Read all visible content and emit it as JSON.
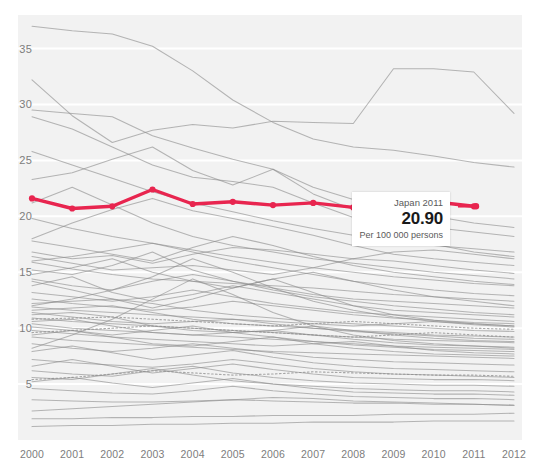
{
  "chart_data": {
    "type": "line",
    "title": "",
    "xlabel": "",
    "ylabel": "",
    "unit": "Per 100 000 persons",
    "x": [
      2000,
      2001,
      2002,
      2003,
      2004,
      2005,
      2006,
      2007,
      2008,
      2009,
      2010,
      2011,
      2012
    ],
    "xtick_labels": [
      "2000",
      "2001",
      "2002",
      "2003",
      "2004",
      "2005",
      "2006",
      "2007",
      "2008",
      "2009",
      "2010",
      "2011",
      "2012"
    ],
    "ytick_labels": [
      "35",
      "30",
      "25",
      "20",
      "15",
      "10",
      "5"
    ],
    "ytick_values": [
      35,
      30,
      25,
      20,
      15,
      10,
      5
    ],
    "ylim": [
      0,
      38
    ],
    "xlim": [
      2000,
      2012
    ],
    "grid": true,
    "legend": "none",
    "highlight_color": "#e8254f",
    "line_color": "#8c8c8c",
    "plot_background": "#f2f2f2",
    "highlight_series": {
      "name": "Japan",
      "values": [
        21.6,
        20.7,
        20.9,
        22.4,
        21.1,
        21.3,
        21.0,
        21.2,
        20.8,
        20.7,
        21.3,
        20.9
      ],
      "x": [
        2000,
        2001,
        2002,
        2003,
        2004,
        2005,
        2006,
        2007,
        2008,
        2009,
        2010,
        2011
      ]
    },
    "series": [
      {
        "name": "s01",
        "style": "solid",
        "values": [
          37.0,
          36.6,
          36.3,
          35.2,
          33.0,
          30.4,
          28.4,
          26.9,
          26.2,
          25.9,
          25.4,
          24.8,
          24.4
        ]
      },
      {
        "name": "s02",
        "style": "solid",
        "values": [
          32.2,
          29.0,
          26.6,
          27.7,
          28.2,
          27.9,
          28.5,
          28.4,
          28.3,
          33.2,
          33.2,
          32.9,
          29.2
        ]
      },
      {
        "name": "s03",
        "style": "solid",
        "values": [
          29.5,
          29.2,
          28.9,
          27.2,
          26.1,
          25.1,
          24.2,
          22.0,
          20.6,
          19.6,
          19.0,
          18.6,
          18.2
        ]
      },
      {
        "name": "s04",
        "style": "solid",
        "values": [
          28.9,
          27.8,
          26.2,
          24.6,
          23.5,
          23.1,
          22.6,
          21.2,
          19.9,
          18.6,
          17.5,
          16.8,
          16.4
        ]
      },
      {
        "name": "s05",
        "style": "solid",
        "values": [
          23.3,
          23.9,
          25.1,
          26.2,
          24.1,
          22.8,
          24.2,
          22.6,
          21.5,
          20.8,
          20.0,
          19.4,
          19.0
        ]
      },
      {
        "name": "s06",
        "style": "solid",
        "values": [
          18.0,
          19.4,
          20.6,
          21.6,
          20.5,
          19.8,
          19.1,
          18.3,
          17.4,
          16.6,
          16.2,
          15.9,
          15.6
        ]
      },
      {
        "name": "s07",
        "style": "solid",
        "values": [
          16.8,
          16.2,
          16.5,
          15.8,
          16.6,
          17.2,
          17.0,
          16.6,
          16.2,
          16.8,
          17.0,
          16.6,
          16.2
        ]
      },
      {
        "name": "s08",
        "style": "solid",
        "values": [
          16.4,
          15.8,
          15.2,
          15.4,
          15.6,
          15.2,
          14.8,
          15.4,
          16.2,
          16.0,
          15.6,
          15.2,
          14.9
        ]
      },
      {
        "name": "s09",
        "style": "solid",
        "values": [
          15.9,
          15.3,
          14.8,
          14.4,
          14.2,
          14.0,
          13.8,
          13.6,
          13.3,
          13.0,
          12.8,
          12.6,
          12.4
        ]
      },
      {
        "name": "s10",
        "style": "solid",
        "values": [
          15.2,
          14.8,
          15.6,
          16.8,
          15.2,
          14.2,
          13.4,
          12.8,
          12.4,
          12.0,
          11.7,
          11.4,
          11.2
        ]
      },
      {
        "name": "s11",
        "style": "solid",
        "values": [
          14.8,
          15.4,
          16.2,
          15.0,
          14.2,
          13.6,
          14.4,
          15.0,
          14.2,
          13.4,
          12.8,
          12.4,
          12.0
        ]
      },
      {
        "name": "s12",
        "style": "solid",
        "values": [
          14.4,
          13.8,
          13.4,
          14.2,
          14.8,
          14.2,
          13.6,
          13.0,
          12.6,
          12.4,
          12.2,
          12.0,
          11.8
        ]
      },
      {
        "name": "s13",
        "style": "solid",
        "values": [
          13.8,
          14.6,
          13.2,
          12.4,
          13.0,
          13.8,
          13.2,
          12.6,
          12.0,
          11.6,
          11.4,
          11.2,
          11.0
        ]
      },
      {
        "name": "s14",
        "style": "solid",
        "values": [
          13.2,
          12.8,
          12.4,
          12.8,
          13.4,
          12.8,
          12.2,
          11.8,
          11.4,
          11.2,
          11.0,
          10.8,
          10.6
        ]
      },
      {
        "name": "s15",
        "style": "solid",
        "values": [
          12.6,
          12.2,
          11.9,
          11.6,
          11.9,
          12.4,
          12.0,
          11.6,
          11.2,
          10.9,
          10.7,
          10.5,
          10.4
        ]
      },
      {
        "name": "s16",
        "style": "solid",
        "values": [
          12.2,
          12.4,
          12.6,
          12.2,
          11.6,
          11.2,
          10.9,
          10.6,
          10.4,
          10.2,
          10.0,
          9.8,
          9.7
        ]
      },
      {
        "name": "s17",
        "style": "solid",
        "values": [
          11.9,
          11.6,
          11.4,
          11.2,
          11.0,
          10.8,
          10.6,
          10.4,
          10.2,
          10.4,
          10.6,
          10.4,
          10.2
        ]
      },
      {
        "name": "s18",
        "style": "solid",
        "values": [
          11.6,
          11.8,
          12.0,
          11.4,
          10.8,
          10.4,
          10.2,
          10.0,
          9.8,
          9.6,
          9.4,
          9.3,
          9.2
        ]
      },
      {
        "name": "s19",
        "style": "solid",
        "values": [
          11.4,
          11.0,
          10.6,
          10.4,
          10.6,
          10.8,
          10.4,
          10.0,
          9.7,
          9.5,
          9.3,
          9.1,
          9.0
        ]
      },
      {
        "name": "s20",
        "style": "solid",
        "values": [
          11.2,
          11.4,
          11.0,
          10.2,
          9.8,
          9.6,
          9.8,
          10.2,
          9.8,
          9.4,
          9.1,
          8.9,
          8.8
        ]
      },
      {
        "name": "s21",
        "style": "solid",
        "values": [
          10.9,
          10.6,
          10.4,
          10.2,
          10.0,
          9.8,
          9.6,
          9.4,
          9.2,
          9.0,
          8.9,
          8.8,
          8.7
        ]
      },
      {
        "name": "s22",
        "style": "solid",
        "values": [
          10.6,
          10.8,
          10.2,
          9.6,
          9.4,
          9.6,
          9.8,
          9.4,
          9.0,
          8.7,
          8.5,
          8.4,
          8.3
        ]
      },
      {
        "name": "s23",
        "style": "solid",
        "values": [
          10.4,
          10.0,
          9.8,
          9.6,
          9.4,
          9.2,
          9.0,
          8.8,
          8.6,
          8.4,
          8.3,
          8.2,
          8.1
        ]
      },
      {
        "name": "s24",
        "style": "solid",
        "values": [
          10.1,
          9.8,
          9.4,
          9.8,
          10.2,
          9.6,
          9.2,
          8.8,
          8.5,
          8.3,
          8.1,
          8.0,
          7.9
        ]
      },
      {
        "name": "s25",
        "style": "solid",
        "values": [
          9.8,
          9.5,
          9.2,
          9.0,
          8.8,
          8.6,
          8.4,
          8.6,
          8.8,
          8.4,
          8.0,
          7.8,
          7.7
        ]
      },
      {
        "name": "s26",
        "style": "solid",
        "values": [
          9.4,
          9.8,
          9.2,
          8.6,
          8.4,
          8.8,
          9.2,
          8.6,
          8.2,
          7.9,
          7.7,
          7.6,
          7.5
        ]
      },
      {
        "name": "s27",
        "style": "solid",
        "values": [
          9.2,
          8.9,
          8.7,
          8.5,
          8.3,
          8.1,
          7.9,
          7.8,
          7.7,
          7.6,
          7.5,
          7.4,
          7.3
        ]
      },
      {
        "name": "s28",
        "style": "dotted",
        "values": [
          10.8,
          10.9,
          11.0,
          10.8,
          10.6,
          10.4,
          10.2,
          10.4,
          10.6,
          10.4,
          10.2,
          10.0,
          9.9
        ]
      },
      {
        "name": "s29",
        "style": "dotted",
        "values": [
          9.6,
          9.8,
          10.0,
          10.2,
          10.0,
          9.8,
          9.6,
          9.4,
          9.2,
          9.4,
          9.6,
          9.4,
          9.2
        ]
      },
      {
        "name": "s30",
        "style": "dotted",
        "values": [
          5.4,
          5.6,
          5.9,
          6.2,
          6.0,
          5.8,
          5.9,
          6.1,
          6.0,
          5.9,
          5.8,
          5.8,
          5.7
        ]
      },
      {
        "name": "s31",
        "style": "solid",
        "values": [
          8.6,
          8.2,
          7.9,
          8.2,
          8.6,
          8.2,
          7.8,
          7.4,
          7.2,
          7.0,
          6.9,
          6.8,
          6.7
        ]
      },
      {
        "name": "s32",
        "style": "solid",
        "values": [
          7.9,
          8.4,
          7.8,
          7.2,
          7.6,
          8.0,
          7.4,
          6.9,
          6.6,
          6.4,
          6.3,
          6.2,
          6.1
        ]
      },
      {
        "name": "s33",
        "style": "solid",
        "values": [
          7.2,
          6.9,
          6.7,
          6.5,
          6.8,
          7.2,
          6.8,
          6.4,
          6.1,
          5.9,
          5.8,
          5.7,
          5.6
        ]
      },
      {
        "name": "s34",
        "style": "solid",
        "values": [
          6.6,
          7.2,
          6.6,
          6.0,
          6.4,
          6.8,
          6.3,
          5.9,
          5.6,
          5.5,
          5.4,
          5.4,
          5.3
        ]
      },
      {
        "name": "s35",
        "style": "solid",
        "values": [
          6.2,
          5.9,
          5.7,
          6.2,
          6.6,
          6.0,
          5.6,
          5.3,
          5.1,
          5.0,
          4.9,
          4.9,
          4.8
        ]
      },
      {
        "name": "s36",
        "style": "solid",
        "values": [
          5.6,
          5.4,
          5.9,
          6.4,
          5.8,
          5.3,
          5.0,
          4.8,
          4.6,
          4.5,
          4.4,
          4.4,
          4.3
        ]
      },
      {
        "name": "s37",
        "style": "solid",
        "values": [
          5.2,
          5.6,
          5.1,
          4.7,
          5.1,
          5.5,
          5.0,
          4.6,
          4.3,
          4.2,
          4.1,
          4.1,
          4.0
        ]
      },
      {
        "name": "s38",
        "style": "solid",
        "values": [
          4.6,
          4.4,
          4.2,
          4.1,
          4.4,
          4.8,
          4.4,
          4.1,
          3.9,
          3.8,
          3.7,
          3.7,
          3.6
        ]
      },
      {
        "name": "s39",
        "style": "solid",
        "values": [
          3.6,
          3.5,
          3.4,
          3.4,
          3.5,
          3.6,
          3.5,
          3.4,
          3.3,
          3.3,
          3.2,
          3.2,
          3.1
        ]
      },
      {
        "name": "s40",
        "style": "solid",
        "values": [
          2.6,
          2.8,
          3.0,
          3.2,
          3.4,
          3.6,
          3.8,
          3.7,
          3.5,
          3.4,
          3.3,
          3.2,
          3.1
        ]
      },
      {
        "name": "s41",
        "style": "solid",
        "values": [
          1.9,
          1.9,
          2.0,
          2.0,
          2.1,
          2.1,
          2.2,
          2.2,
          2.2,
          2.3,
          2.3,
          2.3,
          2.4
        ]
      },
      {
        "name": "s42",
        "style": "solid",
        "values": [
          1.2,
          1.3,
          1.3,
          1.4,
          1.4,
          1.5,
          1.5,
          1.6,
          1.6,
          1.6,
          1.7,
          1.7,
          1.7
        ]
      },
      {
        "name": "s43",
        "style": "solid",
        "values": [
          17.8,
          17.2,
          16.6,
          16.0,
          17.2,
          18.2,
          17.4,
          16.4,
          15.6,
          15.0,
          14.6,
          14.2,
          13.9
        ]
      },
      {
        "name": "s44",
        "style": "solid",
        "values": [
          19.8,
          18.9,
          18.2,
          17.6,
          17.0,
          16.4,
          15.9,
          15.4,
          15.0,
          14.6,
          14.3,
          14.0,
          13.8
        ]
      },
      {
        "name": "s45",
        "style": "solid",
        "values": [
          21.2,
          22.6,
          21.0,
          19.4,
          18.2,
          17.4,
          16.8,
          16.2,
          15.8,
          15.4,
          15.0,
          14.7,
          14.4
        ]
      },
      {
        "name": "s46",
        "style": "solid",
        "values": [
          12.0,
          12.6,
          13.4,
          14.6,
          16.2,
          15.0,
          13.6,
          12.4,
          11.6,
          11.0,
          10.6,
          10.3,
          10.1
        ]
      },
      {
        "name": "s47",
        "style": "solid",
        "values": [
          8.2,
          9.4,
          10.8,
          12.6,
          14.4,
          13.0,
          11.4,
          10.2,
          9.4,
          8.9,
          8.6,
          8.4,
          8.2
        ]
      },
      {
        "name": "s48",
        "style": "solid",
        "values": [
          14.2,
          13.4,
          12.6,
          11.8,
          12.6,
          13.6,
          14.4,
          13.2,
          12.0,
          11.2,
          10.7,
          10.4,
          10.2
        ]
      },
      {
        "name": "s49",
        "style": "solid",
        "values": [
          16.0,
          16.4,
          17.0,
          17.6,
          16.8,
          16.0,
          15.4,
          14.8,
          14.2,
          13.8,
          13.4,
          13.1,
          12.9
        ]
      },
      {
        "name": "s50",
        "style": "solid",
        "values": [
          25.8,
          24.6,
          23.4,
          22.2,
          21.2,
          20.4,
          19.6,
          18.9,
          18.3,
          17.8,
          17.4,
          17.1,
          16.8
        ]
      }
    ]
  },
  "tooltip": {
    "title": "Japan 2011",
    "value": "20.90",
    "unit": "Per 100 000 persons"
  }
}
